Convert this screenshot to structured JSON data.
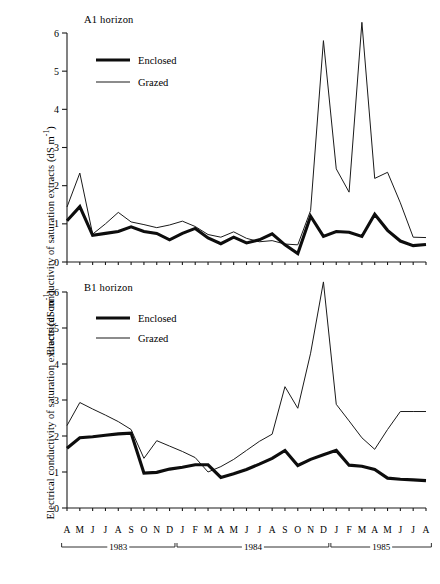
{
  "figure": {
    "ylabel": "Electrical conductivity of saturation extracts (dS m",
    "ylabel_sup": "-1",
    "ylabel_close": ")",
    "legend": {
      "enclosed_label": "Enclosed",
      "grazed_label": "Grazed"
    },
    "panels": [
      {
        "title": "A1 horizon"
      },
      {
        "title": "B1 horizon"
      }
    ],
    "years": [
      {
        "label": "1983"
      },
      {
        "label": "1984"
      },
      {
        "label": "1985"
      }
    ],
    "colors": {
      "enclosed": "#0d0d0d",
      "grazed": "#1a1a1a",
      "axis": "#1a1a1a",
      "background": "#ffffff"
    }
  },
  "chart_data": [
    {
      "id": "a1-horizon",
      "type": "line",
      "title": "A1 horizon",
      "xlabel": "",
      "ylabel": "Electrical conductivity of saturation extracts (dS m-1)",
      "ylim": [
        0,
        6
      ],
      "yticks": [
        0,
        1,
        2,
        3,
        4,
        5,
        6
      ],
      "grid": false,
      "legend_position": "top-left",
      "categories": [
        "A",
        "M",
        "J",
        "J",
        "A",
        "S",
        "O",
        "N",
        "D",
        "J",
        "F",
        "M",
        "A",
        "M",
        "J",
        "J",
        "A",
        "S",
        "O",
        "N",
        "D",
        "J",
        "F",
        "M",
        "A",
        "M",
        "J",
        "J",
        "A"
      ],
      "x_groups": [
        {
          "year": "1983",
          "months": [
            "A",
            "M",
            "J",
            "J",
            "A",
            "S",
            "O",
            "N",
            "D"
          ]
        },
        {
          "year": "1984",
          "months": [
            "J",
            "F",
            "M",
            "A",
            "M",
            "J",
            "J",
            "A",
            "S",
            "O",
            "N",
            "D"
          ]
        },
        {
          "year": "1985",
          "months": [
            "J",
            "F",
            "M",
            "A",
            "M",
            "J",
            "J",
            "A"
          ]
        }
      ],
      "series": [
        {
          "name": "Enclosed",
          "values": [
            1.08,
            1.45,
            0.7,
            0.75,
            0.8,
            0.92,
            0.8,
            0.75,
            0.58,
            0.75,
            0.88,
            0.63,
            0.48,
            0.65,
            0.5,
            0.58,
            0.74,
            0.45,
            0.22,
            1.2,
            0.67,
            0.8,
            0.78,
            0.67,
            1.25,
            0.83,
            0.55,
            0.43,
            0.46,
            0.57
          ]
        },
        {
          "name": "Grazed",
          "values": [
            1.44,
            2.33,
            0.73,
            1.0,
            1.3,
            1.05,
            0.98,
            0.9,
            0.97,
            1.07,
            0.93,
            0.72,
            0.65,
            0.79,
            0.62,
            0.53,
            0.56,
            0.47,
            0.45,
            1.35,
            5.8,
            2.44,
            1.83,
            6.28,
            2.19,
            2.35,
            1.55,
            0.65,
            0.64,
            0.72
          ]
        }
      ]
    },
    {
      "id": "b1-horizon",
      "type": "line",
      "title": "B1 horizon",
      "xlabel": "",
      "ylabel": "Electrical conductivity of saturation extracts (dS m-1)",
      "ylim": [
        0,
        6
      ],
      "yticks": [
        0,
        1,
        2,
        3,
        4,
        5,
        6
      ],
      "grid": false,
      "legend_position": "top-left",
      "categories": [
        "A",
        "M",
        "J",
        "J",
        "A",
        "S",
        "O",
        "N",
        "D",
        "J",
        "F",
        "M",
        "A",
        "M",
        "J",
        "J",
        "A",
        "S",
        "O",
        "N",
        "D",
        "J",
        "F",
        "M",
        "A",
        "M",
        "J",
        "J",
        "A"
      ],
      "x_groups": [
        {
          "year": "1983",
          "months": [
            "A",
            "M",
            "J",
            "J",
            "A",
            "S",
            "O",
            "N",
            "D"
          ]
        },
        {
          "year": "1984",
          "months": [
            "J",
            "F",
            "M",
            "A",
            "M",
            "J",
            "J",
            "A",
            "S",
            "O",
            "N",
            "D"
          ]
        },
        {
          "year": "1985",
          "months": [
            "J",
            "F",
            "M",
            "A",
            "M",
            "J",
            "J",
            "A"
          ]
        }
      ],
      "series": [
        {
          "name": "Enclosed",
          "values": [
            1.66,
            1.95,
            1.98,
            2.02,
            2.06,
            2.08,
            0.97,
            0.99,
            1.08,
            1.13,
            1.2,
            1.2,
            0.85,
            0.95,
            1.07,
            1.22,
            1.38,
            1.6,
            1.18,
            1.35,
            1.48,
            1.6,
            1.19,
            1.16,
            1.07,
            0.83,
            0.8,
            0.78,
            0.76
          ]
        },
        {
          "name": "Grazed",
          "values": [
            2.29,
            2.93,
            2.75,
            2.58,
            2.4,
            2.18,
            1.38,
            1.87,
            1.72,
            1.57,
            1.4,
            1.0,
            1.15,
            1.35,
            1.6,
            1.85,
            2.05,
            3.37,
            2.77,
            4.3,
            6.28,
            2.88,
            2.42,
            1.95,
            1.63,
            2.18,
            2.68,
            2.68,
            2.68
          ]
        }
      ]
    }
  ]
}
